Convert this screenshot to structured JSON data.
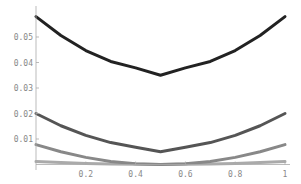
{
  "chart_data": {
    "type": "line",
    "title": "",
    "xlabel": "",
    "ylabel": "",
    "xlim": [
      0,
      1
    ],
    "ylim": [
      0,
      0.06
    ],
    "grid": false,
    "legend": null,
    "x_ticks": [
      0.2,
      0.4,
      0.6,
      0.8,
      1
    ],
    "x_tick_labels": [
      "0.2",
      "0.4",
      "0.6",
      "0.8",
      "1"
    ],
    "y_ticks": [
      0.01,
      0.02,
      0.03,
      0.04,
      0.05
    ],
    "y_tick_labels": [
      "0.01",
      "0.02",
      "0.03",
      "0.04",
      "0.05"
    ],
    "x": [
      0,
      0.1,
      0.2,
      0.3,
      0.4,
      0.5,
      0.6,
      0.7,
      0.8,
      0.9,
      1.0
    ],
    "series": [
      {
        "name": "curve-1",
        "color": "#222222",
        "width": 3,
        "values": [
          0.058,
          0.0506,
          0.0447,
          0.0404,
          0.0379,
          0.035,
          0.0379,
          0.0404,
          0.0447,
          0.0506,
          0.058
        ]
      },
      {
        "name": "curve-2",
        "color": "#555555",
        "width": 3,
        "values": [
          0.02,
          0.0152,
          0.0114,
          0.0086,
          0.0068,
          0.005,
          0.0068,
          0.0086,
          0.0114,
          0.0152,
          0.02
        ]
      },
      {
        "name": "curve-3",
        "color": "#888888",
        "width": 3,
        "values": [
          0.0078,
          0.005,
          0.0028,
          0.0012,
          0.0003,
          0.0,
          0.0003,
          0.0012,
          0.0028,
          0.005,
          0.0078
        ]
      },
      {
        "name": "curve-4",
        "color": "#aaaaaa",
        "width": 3,
        "values": [
          0.0012,
          0.0008,
          0.0004,
          0.0002,
          0.0001,
          0.0,
          0.0001,
          0.0002,
          0.0004,
          0.0008,
          0.0012
        ]
      }
    ]
  }
}
